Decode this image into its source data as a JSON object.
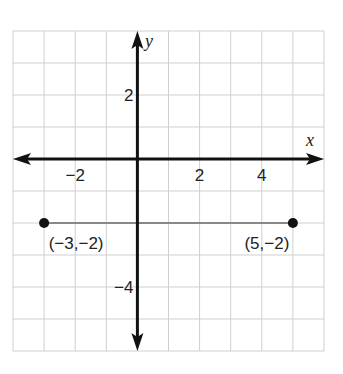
{
  "chart_data": {
    "type": "scatter",
    "title": "",
    "xlabel": "x",
    "ylabel": "y",
    "xlim": [
      -4,
      6
    ],
    "ylim": [
      -6,
      4
    ],
    "grid": true,
    "x_ticks": [
      {
        "value": -2,
        "label": "−2"
      },
      {
        "value": 2,
        "label": "2"
      },
      {
        "value": 4,
        "label": "4"
      }
    ],
    "y_ticks": [
      {
        "value": 2,
        "label": "2"
      },
      {
        "value": -4,
        "label": "−4"
      }
    ],
    "points": [
      {
        "x": -3,
        "y": -2,
        "label": "(−3,−2)"
      },
      {
        "x": 5,
        "y": -2,
        "label": "(5,−2)"
      }
    ],
    "segments": [
      {
        "from": [
          -3,
          -2
        ],
        "to": [
          5,
          -2
        ],
        "color": "#888888"
      }
    ],
    "colors": {
      "grid": "#cfcfcf",
      "axis": "#111111",
      "segment": "#888888",
      "point": "#111111"
    }
  }
}
